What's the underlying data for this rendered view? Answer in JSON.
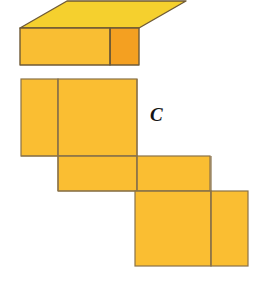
{
  "figure": {
    "label": "C",
    "caption_letter": "C",
    "background_color": "#ffffff",
    "stroke_color": "#8a7248",
    "stroke_width": 1.2,
    "solid": {
      "name": "rectangular-prism",
      "top_face_color": "#f5d02e",
      "front_face_color": "#f9be33",
      "side_face_color": "#f4a021",
      "top_face_points": "20,28 67,1 186,1 139,28",
      "front_face_points": "20,28 110,28 110,65 20,65",
      "side_face_points": "110,28 139,28 139,65 110,65",
      "hidden": false
    },
    "net": {
      "name": "unfolded-net",
      "fill_color": "#fabe32",
      "faces": [
        {
          "name": "net-face-top-left-small",
          "x": 21,
          "y": 79,
          "width": 37,
          "height": 77
        },
        {
          "name": "net-face-top-right-large",
          "x": 58,
          "y": 79,
          "width": 79,
          "height": 77
        },
        {
          "name": "net-face-middle-left",
          "x": 58,
          "y": 156,
          "width": 79,
          "height": 35
        },
        {
          "name": "net-face-middle-right",
          "x": 137,
          "y": 156,
          "width": 73,
          "height": 35
        },
        {
          "name": "net-face-bottom-left-large",
          "x": 135,
          "y": 191,
          "width": 76,
          "height": 75
        },
        {
          "name": "net-face-bottom-right-small",
          "x": 211,
          "y": 191,
          "width": 37,
          "height": 75
        }
      ]
    }
  }
}
